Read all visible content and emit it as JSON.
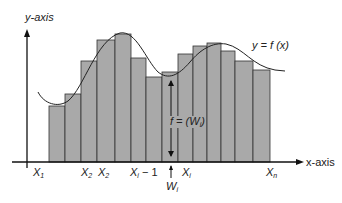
{
  "diagram": {
    "y_axis_label": "y-axis",
    "x_axis_label": "x-axis",
    "curve_label": "y = f (x)",
    "height_label": "f = (W",
    "height_label_sub": "i",
    "height_label_close": ")",
    "tick_labels": [
      {
        "base": "X",
        "sub": "1",
        "suffix": "",
        "x": 33
      },
      {
        "base": "X",
        "sub": "2",
        "suffix": "",
        "x": 81
      },
      {
        "base": "X",
        "sub": "2",
        "suffix": "",
        "x": 98
      },
      {
        "base": "X",
        "sub": "i",
        "suffix": " − 1",
        "x": 130
      },
      {
        "base": "X",
        "sub": "i",
        "suffix": "",
        "x": 182
      },
      {
        "base": "X",
        "sub": "n",
        "suffix": "",
        "x": 266
      }
    ],
    "w_label": {
      "base": "W",
      "sub": "i"
    },
    "colors": {
      "bar_fill": "#a9a9a9",
      "bar_stroke": "#333333",
      "axis": "#111111",
      "curve": "#222222"
    },
    "bars": [
      {
        "x0": 49,
        "x1": 65,
        "top": 106
      },
      {
        "x0": 65,
        "x1": 81,
        "top": 94
      },
      {
        "x0": 81,
        "x1": 97,
        "top": 61
      },
      {
        "x0": 97,
        "x1": 115,
        "top": 40
      },
      {
        "x0": 115,
        "x1": 131,
        "top": 34
      },
      {
        "x0": 131,
        "x1": 146,
        "top": 58
      },
      {
        "x0": 146,
        "x1": 162,
        "top": 77
      },
      {
        "x0": 162,
        "x1": 178,
        "top": 72
      },
      {
        "x0": 178,
        "x1": 193,
        "top": 54
      },
      {
        "x0": 193,
        "x1": 207,
        "top": 46
      },
      {
        "x0": 207,
        "x1": 221,
        "top": 43
      },
      {
        "x0": 221,
        "x1": 235,
        "top": 51
      },
      {
        "x0": 235,
        "x1": 253,
        "top": 61
      },
      {
        "x0": 253,
        "x1": 270,
        "top": 70
      }
    ]
  }
}
